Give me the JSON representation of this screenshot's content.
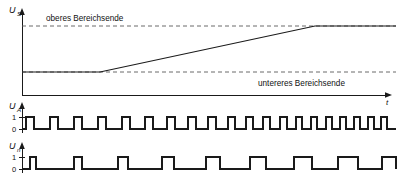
{
  "figure": {
    "title_visible": false,
    "background_color": "#ffffff",
    "line_color": "#1a1a1a",
    "dash_color": "#5a5a5a"
  },
  "chart_data": {
    "type": "line",
    "title": "",
    "xlabel": "t",
    "ylabel": "U_S",
    "grid": false,
    "legend": null,
    "panels": [
      {
        "name": "analog-ramp-panel",
        "ylabel": "U",
        "ylabel_sub": "S",
        "xlabel": "t",
        "annotations": [
          {
            "name": "upper-range-label",
            "text": "oberes Bereichsende",
            "x": 46,
            "y": 21
          },
          {
            "name": "lower-range-label",
            "text": "untereres Bereichsende",
            "x": 258,
            "y": 86
          }
        ],
        "reference_lines": [
          {
            "name": "upper-range-dashed",
            "level": "oberes Bereichsende",
            "y": 26,
            "x1": 22,
            "x2": 396
          },
          {
            "name": "lower-range-dashed",
            "level": "untereres Bereichsende",
            "y": 72,
            "x1": 22,
            "x2": 396
          }
        ],
        "axis": {
          "x_origin": 22,
          "y_baseline": 95,
          "x_end": 392,
          "y_top": 10
        },
        "series": [
          {
            "name": "ramp-signal",
            "points": [
              {
                "x": 22,
                "y": 72
              },
              {
                "x": 100,
                "y": 72
              },
              {
                "x": 315,
                "y": 26
              },
              {
                "x": 396,
                "y": 26
              }
            ]
          }
        ]
      },
      {
        "name": "digital-signal-panel-a",
        "ylabel": "U",
        "ylabel_sub": "A",
        "tick_labels": [
          "1",
          "0"
        ],
        "axis": {
          "x_origin": 22,
          "y_high": 117,
          "y_low": 129,
          "x_end": 396,
          "y_top": 104
        },
        "description": "Rechtecksignal mit zunehmender Frequenz, konstante Impulsbreite",
        "edges": [
          26,
          34,
          50,
          58,
          74,
          82,
          98,
          106,
          122,
          130,
          145,
          153,
          167,
          175,
          188,
          196,
          208,
          216,
          228,
          235,
          246,
          253,
          263,
          270,
          280,
          287,
          296,
          302,
          311,
          317,
          326,
          332,
          340,
          346,
          354,
          360,
          368,
          374,
          381,
          387
        ]
      },
      {
        "name": "digital-signal-panel-n",
        "ylabel": "U",
        "ylabel_sub": "n",
        "tick_labels": [
          "1",
          "0"
        ],
        "axis": {
          "x_origin": 22,
          "y_high": 157,
          "y_low": 169,
          "x_end": 396,
          "y_top": 144
        },
        "description": "Rechtecksignal mit konstanter Periode und zunehmender Pulsbreite",
        "edges": [
          30,
          36,
          74,
          82,
          118,
          128,
          162,
          174,
          206,
          220,
          250,
          266,
          294,
          312,
          338,
          358,
          382,
          396
        ]
      }
    ]
  },
  "labels": {
    "upper_range": "oberes Bereichsende",
    "lower_range": "untereres Bereichsende",
    "time_axis": "t",
    "voltage_s": "U",
    "voltage_s_sub": "S",
    "voltage_a": "U",
    "voltage_a_sub": "A",
    "voltage_n": "U",
    "voltage_n_sub": "n",
    "tick_high": "1",
    "tick_low": "0"
  }
}
